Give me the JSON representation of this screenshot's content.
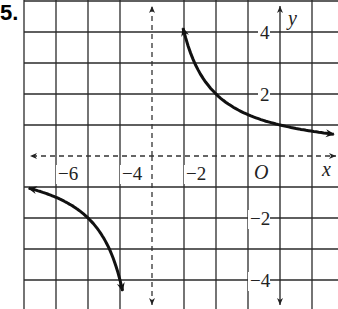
{
  "problem": {
    "number_label": "5."
  },
  "chart_data": {
    "type": "line",
    "title": "",
    "function": "y = 4/(x+4)",
    "xlabel": "x",
    "ylabel": "y",
    "origin_label": "O",
    "xlim": [
      -8,
      1.5
    ],
    "ylim": [
      -4.5,
      5
    ],
    "grid": true,
    "grid_step": 1,
    "x_tick_labels": [
      {
        "value": -6,
        "label": "−6"
      },
      {
        "value": -4,
        "label": "−4"
      },
      {
        "value": -2,
        "label": "−2"
      }
    ],
    "y_tick_labels": [
      {
        "value": 4,
        "label": "4"
      },
      {
        "value": 2,
        "label": "2"
      },
      {
        "value": -2,
        "label": "−2"
      },
      {
        "value": -4,
        "label": "−4"
      }
    ],
    "asymptotes": [
      {
        "type": "vertical",
        "x": -4,
        "style": "dashed"
      },
      {
        "type": "horizontal",
        "y": 0,
        "style": "dashed"
      }
    ],
    "series": [
      {
        "name": "right branch",
        "x": [
          -3.02,
          -3,
          -2.5,
          -2,
          -1.5,
          -1,
          0,
          1,
          1.7
        ],
        "y": [
          4.1,
          4,
          2.67,
          2,
          1.6,
          1.33,
          1,
          0.8,
          0.7
        ]
      },
      {
        "name": "left branch",
        "x": [
          -7.9,
          -7,
          -6,
          -5.5,
          -5,
          -4.9
        ],
        "y": [
          -1.03,
          -1.33,
          -2,
          -2.67,
          -4,
          -4.44
        ]
      }
    ]
  }
}
